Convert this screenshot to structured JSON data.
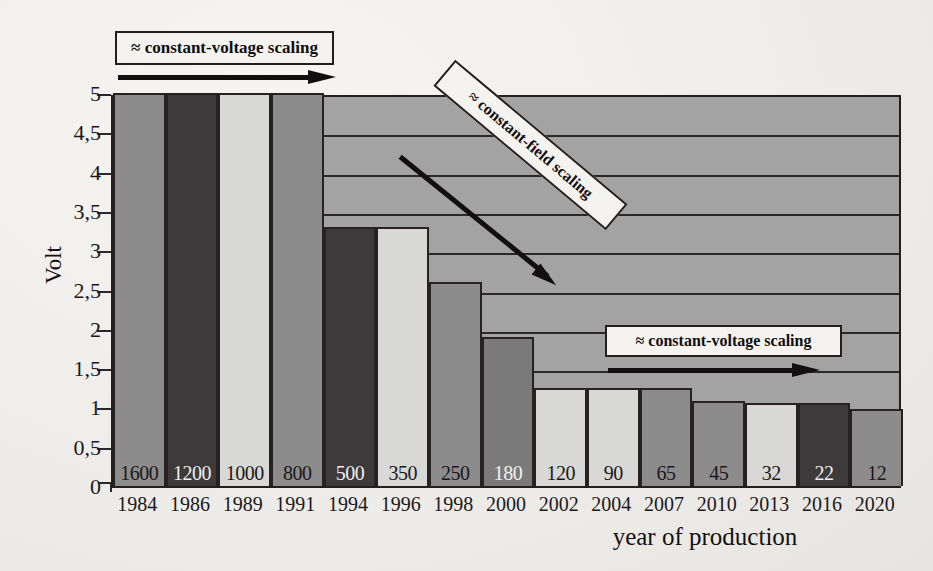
{
  "chart_data": {
    "type": "bar",
    "title": "",
    "xlabel": "year of production",
    "ylabel": "Volt",
    "ylim": [
      0,
      5
    ],
    "ytick_labels": [
      "5",
      "4,5",
      "4",
      "3,5",
      "3",
      "2,5",
      "2",
      "1,5",
      "1",
      "0,5",
      "0"
    ],
    "ytick_values": [
      5,
      4.5,
      4,
      3.5,
      3,
      2.5,
      2,
      1.5,
      1,
      0.5,
      0
    ],
    "grid": true,
    "legend": "none",
    "categories": [
      "1984",
      "1986",
      "1989",
      "1991",
      "1994",
      "1996",
      "1998",
      "2000",
      "2002",
      "2004",
      "2007",
      "2010",
      "2013",
      "2016",
      "2020"
    ],
    "bar_labels": [
      "1600",
      "1200",
      "1000",
      "800",
      "500",
      "350",
      "250",
      "180",
      "120",
      "90",
      "65",
      "45",
      "32",
      "22",
      "12"
    ],
    "values": [
      5.0,
      5.0,
      5.0,
      5.0,
      3.3,
      3.3,
      2.6,
      1.9,
      1.25,
      1.25,
      1.25,
      1.08,
      1.05,
      1.05,
      0.98
    ],
    "bar_fill_order": [
      "mid",
      "dark",
      "light",
      "mid",
      "dark",
      "light",
      "mid",
      "mid2",
      "light",
      "light",
      "mid",
      "mid",
      "light",
      "dark",
      "mid"
    ],
    "annotations": [
      {
        "id": "ann1",
        "text": "≈ constant-voltage scaling",
        "direction": "right"
      },
      {
        "id": "ann2",
        "text": "≈ constant-field scaling",
        "direction": "down-right"
      },
      {
        "id": "ann3",
        "text": "≈ constant-voltage scaling",
        "direction": "right"
      }
    ],
    "colors": {
      "plot_background": "#a3a3a3",
      "page_background": "#f2f1ee",
      "axis": "#231f20",
      "bar_mid": "#8c8c8c",
      "bar_mid2": "#7b7a7a",
      "bar_dark": "#3c3a3b",
      "bar_light": "#d8d8d6",
      "annotation_box": "#f4f3f0"
    }
  }
}
